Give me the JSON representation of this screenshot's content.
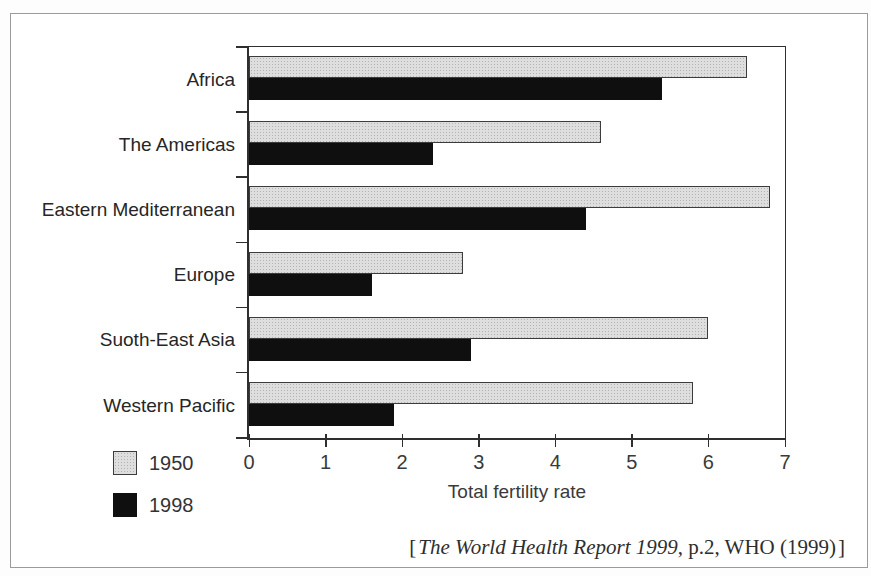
{
  "chart_data": {
    "type": "bar",
    "orientation": "horizontal",
    "categories": [
      "Africa",
      "The Americas",
      "Eastern Mediterranean",
      "Europe",
      "Suoth-East Asia",
      "Western Pacific"
    ],
    "series": [
      {
        "name": "1950",
        "color": "#dedede",
        "values": [
          6.5,
          4.6,
          6.8,
          2.8,
          6.0,
          5.8
        ]
      },
      {
        "name": "1998",
        "color": "#0f0f0f",
        "values": [
          5.4,
          2.4,
          4.4,
          1.6,
          2.9,
          1.9
        ]
      }
    ],
    "xlabel": "Total fertility rate",
    "xlim": [
      0,
      7
    ],
    "xticks": [
      0,
      1,
      2,
      3,
      4,
      5,
      6,
      7
    ],
    "grid": false,
    "legend_position": "bottom-left",
    "source": "[The World Health Report 1999, p.2, WHO (1999)]"
  },
  "source_parts": {
    "open": "[",
    "title": "The World Health Report 1999",
    "rest": ", p.2, WHO (1999)",
    "close": "]"
  }
}
